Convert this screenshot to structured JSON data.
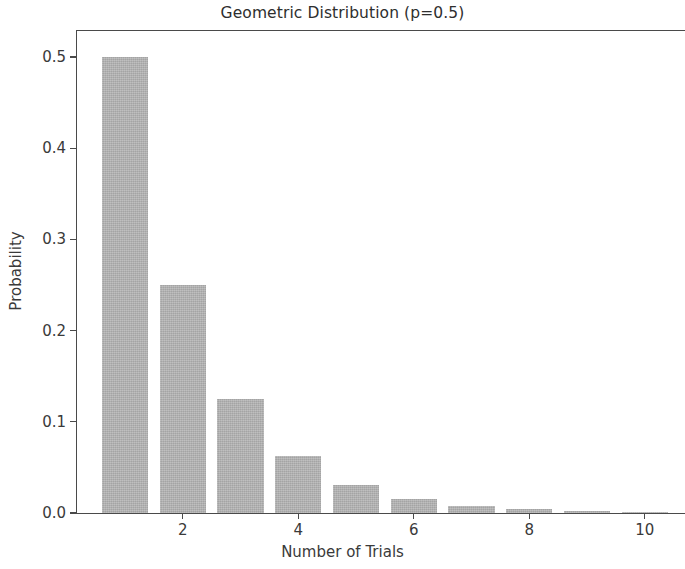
{
  "chart_data": {
    "type": "bar",
    "title": "Geometric Distribution (p=0.5)",
    "xlabel": "Number of Trials",
    "ylabel": "Probability",
    "categories": [
      1,
      2,
      3,
      4,
      5,
      6,
      7,
      8,
      9,
      10
    ],
    "values": [
      0.5,
      0.25,
      0.125,
      0.0625,
      0.03125,
      0.015625,
      0.0078125,
      0.00390625,
      0.001953125,
      0.0009765625
    ],
    "series": [
      {
        "name": "Geometric PMF (p=0.5)",
        "values": [
          0.5,
          0.25,
          0.125,
          0.0625,
          0.03125,
          0.015625,
          0.0078125,
          0.00390625,
          0.001953125,
          0.0009765625
        ]
      }
    ],
    "xticks": [
      2,
      4,
      6,
      8,
      10
    ],
    "xtick_labels": [
      "2",
      "4",
      "6",
      "8",
      "10"
    ],
    "yticks": [
      0.0,
      0.1,
      0.2,
      0.3,
      0.4,
      0.5
    ],
    "ytick_labels": [
      "0.0",
      "0.1",
      "0.2",
      "0.3",
      "0.4",
      "0.5"
    ],
    "xlim": [
      0.5,
      10.55
    ],
    "ylim": [
      0.0,
      0.53
    ],
    "grid": false,
    "legend": null,
    "bar_color": "#b1b1b1",
    "bar_width": 0.8,
    "axis_color": "#4a4a4a",
    "text_color": "#3a3a3a",
    "background": "#ffffff"
  }
}
